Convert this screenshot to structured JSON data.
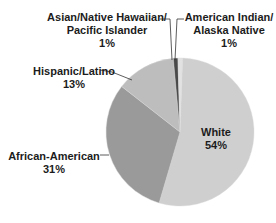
{
  "chart_data": {
    "type": "pie",
    "title": "",
    "categories": [
      "White",
      "African-American",
      "Hispanic/Latino",
      "Asian/Native Hawaiian/Pacific Islander",
      "American Indian/Alaska Native"
    ],
    "values": [
      54,
      31,
      13,
      1,
      1
    ],
    "labels": {
      "white": {
        "name": "White",
        "pct": "54%"
      },
      "african_american": {
        "name": "African-American",
        "pct": "31%"
      },
      "hispanic": {
        "name": "Hispanic/Latino",
        "pct": "13%"
      },
      "asian": {
        "line1": "Asian/Native Hawaiian/",
        "line2": "Pacific Islander",
        "pct": "1%"
      },
      "american_indian": {
        "line1": "American Indian/",
        "line2": "Alaska Native",
        "pct": "1%"
      }
    },
    "colors": {
      "white": "#cfcfcf",
      "african_american": "#9a9a9a",
      "hispanic": "#bdbdbd",
      "asian": "#4a4a4a",
      "american_indian": "#e2e2e2"
    },
    "legend": "none (direct labels)"
  }
}
